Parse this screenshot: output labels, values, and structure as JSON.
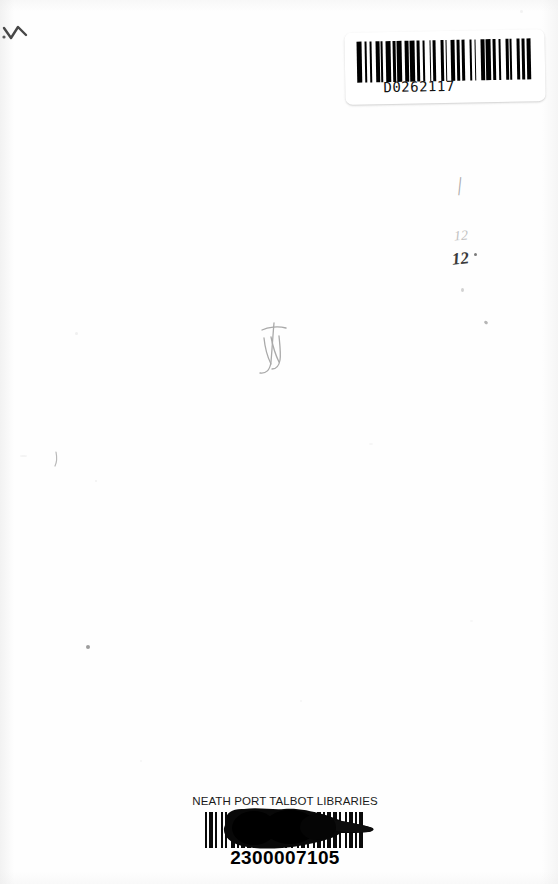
{
  "document": {
    "type": "scanned-book-page",
    "description": "Scanned inside cover of a library book with two barcode labels"
  },
  "top_label": {
    "name": "publisher-barcode-sticker",
    "number": "D0262117",
    "bar_pattern": [
      3,
      2,
      1,
      2,
      1,
      3,
      2,
      1,
      1,
      2,
      3,
      1,
      2,
      1,
      3,
      2,
      2,
      1,
      3,
      1,
      2,
      2,
      1,
      3,
      1,
      1,
      2,
      3,
      2,
      1,
      1,
      2,
      3,
      1,
      2,
      1,
      2,
      3,
      1,
      2,
      1,
      3,
      2,
      1,
      3,
      1,
      2,
      2,
      1,
      3,
      2,
      1,
      1,
      3,
      2,
      1,
      2,
      1,
      3,
      2
    ]
  },
  "bottom_label": {
    "name": "library-barcode",
    "library": "NEATH PORT TALBOT LIBRARIES",
    "number": "2300007105",
    "bar_pattern": [
      1,
      1,
      2,
      1,
      1,
      2,
      1,
      1,
      1,
      2,
      2,
      1,
      1,
      1,
      2,
      1,
      2,
      1,
      1,
      1,
      2,
      2,
      1,
      1,
      2,
      1,
      1,
      2,
      1,
      1,
      1,
      2,
      1,
      2,
      1,
      1,
      2,
      1,
      1,
      2,
      1,
      1,
      2,
      1,
      1,
      1,
      2,
      1,
      2,
      1,
      1,
      2,
      1,
      1,
      2,
      1,
      1,
      1,
      2,
      1
    ]
  },
  "annotations": {
    "price_mark_dark": "12",
    "price_mark_faint": "12",
    "tick_mark": "|",
    "corner_mark": "pencil-stroke",
    "center_scribble": "pencil-scribble"
  },
  "colors": {
    "paper": "#fefefe",
    "ink": "#000000",
    "pencil": "#5a5a5a",
    "pencil_faint": "#c2c2c2"
  }
}
